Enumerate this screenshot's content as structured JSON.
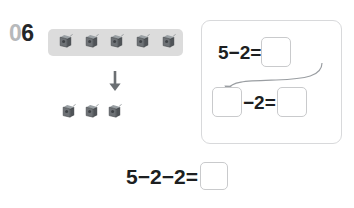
{
  "problem": {
    "number_prefix": "0",
    "number_suffix": "6",
    "number_full": "06"
  },
  "manipulatives": {
    "icon_name": "gray-cube",
    "top_group": {
      "label": "highlighted-group",
      "count": 5,
      "band_color": "#dcdcdc"
    },
    "arrow": {
      "icon_name": "down-arrow",
      "glyph": "↓"
    },
    "bottom_group": {
      "label": "remaining-group",
      "count": 3
    }
  },
  "work_panel": {
    "step_one": {
      "minuend": "5",
      "operator": "−",
      "subtrahend": "2",
      "equals": "=",
      "expression": "5−2=",
      "answer_value": "",
      "answer_placeholder": ""
    },
    "carry_arrow": {
      "icon_name": "curved-arrow-down-left"
    },
    "step_two": {
      "first_box_value": "",
      "operator": "−",
      "subtrahend": "2",
      "equals": "=",
      "expression": "−2=",
      "answer_value": "",
      "answer_placeholder": ""
    }
  },
  "main_equation": {
    "expression": "5−2−2=",
    "answer_value": "",
    "answer_placeholder": ""
  },
  "colors": {
    "number_muted": "#b7b9bb",
    "number_dark": "#242628",
    "band": "#dcdcdc",
    "panel_border": "#d8d9db",
    "box_border": "#c9cacc",
    "text": "#1d1f21",
    "cube_dark": "#565a5e",
    "cube_mid": "#75797d",
    "cube_light": "#9aa0a4"
  }
}
